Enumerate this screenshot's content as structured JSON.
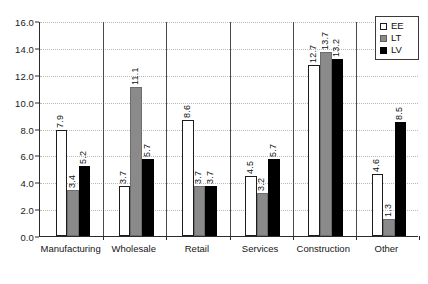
{
  "chart_data": {
    "type": "bar",
    "title": "",
    "subtitle": "",
    "xlabel": "",
    "ylabel": "",
    "ylim": [
      0.0,
      16.0
    ],
    "ytick_step": 2.0,
    "ytick_labels": [
      "0.0",
      "2.0",
      "4.0",
      "6.0",
      "8.0",
      "10.0",
      "12.0",
      "14.0",
      "16.0"
    ],
    "grid": true,
    "grid_style": "dotted-horizontal",
    "legend_position": "top-right",
    "orientation": "vertical",
    "grouping": "clustered",
    "data_labels": true,
    "data_label_rotation": "90",
    "categories": [
      "Manufacturing",
      "Wholesale",
      "Retail",
      "Services",
      "Construction",
      "Other"
    ],
    "series": [
      {
        "name": "EE",
        "color": "#ffffff",
        "edge_color": "#1c1c1c",
        "values": [
          7.9,
          3.7,
          8.6,
          4.5,
          12.7,
          4.6
        ],
        "labels": [
          "7.9",
          "3.7",
          "8.6",
          "4.5",
          "12.7",
          "4.6"
        ]
      },
      {
        "name": "LT",
        "color": "#8a8a8a",
        "edge_color": "#6d6d6d",
        "values": [
          3.4,
          11.1,
          3.7,
          3.2,
          13.7,
          1.3
        ],
        "labels": [
          "3.4",
          "11.1",
          "3.7",
          "3.2",
          "13.7",
          "1.3"
        ]
      },
      {
        "name": "LV",
        "color": "#000000",
        "edge_color": "#000000",
        "values": [
          5.2,
          5.7,
          3.7,
          5.7,
          13.2,
          8.5
        ],
        "labels": [
          "5.2",
          "5.7",
          "3.7",
          "5.7",
          "13.2",
          "8.5"
        ]
      }
    ]
  },
  "legend": {
    "entries": [
      {
        "label": "EE",
        "swatch": "ee"
      },
      {
        "label": "LT",
        "swatch": "lt"
      },
      {
        "label": "LV",
        "swatch": "lv"
      }
    ]
  },
  "colors": {
    "axis": "#2b2b2b",
    "grid": "#b9b9b9",
    "text": "#111111",
    "background": "#ffffff"
  }
}
